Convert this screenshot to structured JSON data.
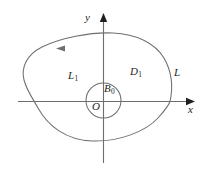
{
  "figure": {
    "type": "math-diagram",
    "background_color": "#ffffff",
    "stroke_color": "#6d6e71",
    "axis_color": "#6d6e71",
    "text_color": "#231f20",
    "axes": {
      "x_axis_label": "x",
      "y_axis_label": "y",
      "origin_label": "O",
      "x_axis_arrow": "arrow-right",
      "y_axis_arrow": "arrow-up"
    },
    "labels": {
      "outer_curve": "L",
      "outer_region": "D",
      "outer_region_sub": "1",
      "inner_circle": "L",
      "inner_circle_sub": "1",
      "inner_region": "B",
      "inner_region_sub": "0"
    },
    "orientation_marker": {
      "name": "direction-arrow",
      "position": "upper-left of outer curve",
      "direction": "counterclockwise-left"
    }
  }
}
